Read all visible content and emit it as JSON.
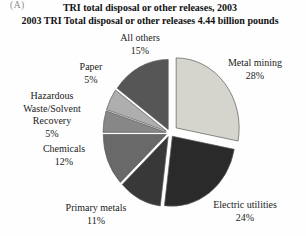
{
  "figure_label": "(A)",
  "chart_data": {
    "type": "pie",
    "title": "TRI total disposal or other releases, 2003",
    "subtitle": "2003 TRI Total disposal or other releases 4.44 billion pounds",
    "total_label": "4.44 billion pounds",
    "units": "percent",
    "start_angle_deg": 0,
    "direction": "clockwise",
    "exploded": true,
    "legend_position": "labels-around-pie",
    "slices": [
      {
        "name": "Metal mining",
        "value": 28,
        "pct": "28%",
        "color": "#d6d5cd"
      },
      {
        "name": "Electric utilities",
        "value": 24,
        "pct": "24%",
        "color": "#2a2a2a"
      },
      {
        "name": "Primary metals",
        "value": 11,
        "pct": "11%",
        "color": "#383838"
      },
      {
        "name": "Chemicals",
        "value": 12,
        "pct": "12%",
        "color": "#696969"
      },
      {
        "name": "Hazardous Waste/Solvent Recovery",
        "value": 5,
        "pct": "5%",
        "color": "#878787"
      },
      {
        "name": "Paper",
        "value": 5,
        "pct": "5%",
        "color": "#aeaeae"
      },
      {
        "name": "All others",
        "value": 15,
        "pct": "15%",
        "color": "#565656"
      }
    ],
    "outline_color": "#5a5a5a"
  }
}
